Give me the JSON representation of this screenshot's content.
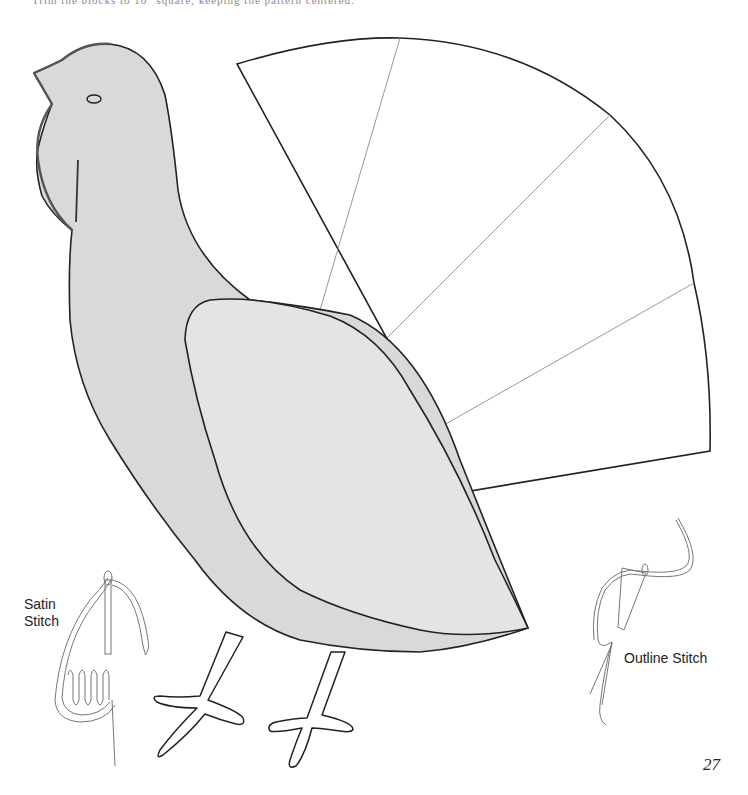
{
  "page": {
    "top_text": "Trim the blocks to 10\" square, keeping the pattern centered.",
    "page_number": "27"
  },
  "pattern": {
    "subject": "Turkey appliqué template",
    "body_fill": "#d9d9d9",
    "wing_fill": "#e4e4e4",
    "outline_color": "#222222",
    "fan_divider_color": "#999999",
    "tail_fan_sections": 5
  },
  "stitch_labels": {
    "satin": "Satin Stitch",
    "satin_line1": "Satin",
    "satin_line2": "Stitch",
    "outline": "Outline Stitch"
  }
}
